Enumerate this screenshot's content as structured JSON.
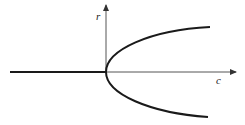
{
  "diagram": {
    "title": "",
    "type": "pitchfork-bifurcation",
    "axes": {
      "horizontal_label": "c",
      "vertical_label": "r"
    },
    "colors": {
      "line": "#1a1a1a",
      "axis": "#555555",
      "background": "#ffffff"
    }
  }
}
